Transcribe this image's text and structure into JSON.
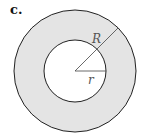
{
  "figure": {
    "label": "c.",
    "outer_radius_label": "R",
    "inner_radius_label": "r",
    "colors": {
      "annulus_fill": "#e4e4e4",
      "inner_fill": "#ffffff",
      "stroke": "#222222",
      "radius_line": "#444444"
    }
  }
}
